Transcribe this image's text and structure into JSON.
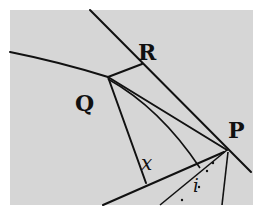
{
  "diagram": {
    "background": "#d6d6d6",
    "border": "#ffffff",
    "points": {
      "Q": {
        "label": "Q",
        "x": 108,
        "y": 77
      },
      "R": {
        "label": "R",
        "x": 142,
        "y": 63
      },
      "P": {
        "label": "P",
        "x": 227,
        "y": 150
      }
    },
    "angle_labels": {
      "x": "x",
      "i": "i"
    }
  }
}
